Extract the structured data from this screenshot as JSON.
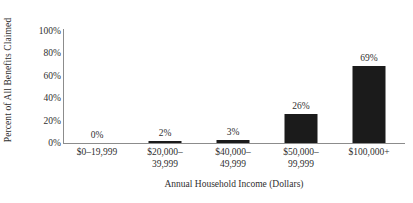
{
  "chart_data": {
    "type": "bar",
    "title": "",
    "xlabel": "Annual Household Income (Dollars)",
    "ylabel": "Percent of All Benefits  Claimed",
    "categories": [
      "$0–19,999",
      "$20,000–\n39,999",
      "$40,000–\n49,999",
      "$50,000–\n99,999",
      "$100,000+"
    ],
    "category_lines": [
      [
        "$0–19,999",
        ""
      ],
      [
        "$20,000–",
        "39,999"
      ],
      [
        "$40,000–",
        "49,999"
      ],
      [
        "$50,000–",
        "99,999"
      ],
      [
        "$100,000+",
        ""
      ]
    ],
    "values": [
      0,
      2,
      3,
      26,
      69
    ],
    "value_labels": [
      "0%",
      "2%",
      "3%",
      "26%",
      "69%"
    ],
    "ylim": [
      0,
      100
    ],
    "yticks": [
      0,
      20,
      40,
      60,
      80,
      100
    ],
    "ytick_labels": [
      "0%",
      "20%",
      "40%",
      "60%",
      "80%",
      "100%"
    ],
    "grid": false,
    "legend": "none",
    "bar_color": "#1b1b1b",
    "axis_color": "#8c8c8c",
    "text_color": "#2f2f2f"
  }
}
